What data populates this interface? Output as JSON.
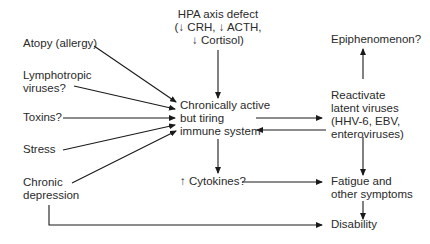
{
  "diagram": {
    "type": "flowchart",
    "nodes": {
      "hpa": {
        "lines": [
          "HPA axis defect",
          "(↓ CRH, ↓ ACTH,",
          "↓ Cortisol)"
        ]
      },
      "atopy": {
        "lines": [
          "Atopy (allergy)"
        ]
      },
      "lymphotropic": {
        "lines": [
          "Lymphotropic",
          "viruses?"
        ]
      },
      "toxins": {
        "lines": [
          "Toxins?"
        ]
      },
      "stress": {
        "lines": [
          "Stress"
        ]
      },
      "depression": {
        "lines": [
          "Chronic",
          "depression"
        ]
      },
      "immune": {
        "lines": [
          "Chronically active",
          "but tiring",
          "immune system"
        ]
      },
      "cytokines": {
        "lines": [
          "↑ Cytokines?"
        ]
      },
      "epiphenomenon": {
        "lines": [
          "Epiphenomenon?"
        ]
      },
      "reactivate": {
        "lines": [
          "Reactivate",
          "latent viruses",
          "(HHV-6, EBV,",
          "enteroviruses)"
        ]
      },
      "fatigue": {
        "lines": [
          "Fatigue and",
          "other symptoms"
        ]
      },
      "disability": {
        "lines": [
          "Disability"
        ]
      }
    },
    "edges": [
      {
        "from": "hpa",
        "to": "immune"
      },
      {
        "from": "atopy",
        "to": "immune"
      },
      {
        "from": "lymphotropic",
        "to": "immune"
      },
      {
        "from": "toxins",
        "to": "immune"
      },
      {
        "from": "stress",
        "to": "immune"
      },
      {
        "from": "depression",
        "to": "immune"
      },
      {
        "from": "immune",
        "to": "reactivate"
      },
      {
        "from": "reactivate",
        "to": "immune"
      },
      {
        "from": "reactivate",
        "to": "epiphenomenon"
      },
      {
        "from": "immune",
        "to": "cytokines"
      },
      {
        "from": "cytokines",
        "to": "fatigue"
      },
      {
        "from": "reactivate",
        "to": "fatigue"
      },
      {
        "from": "fatigue",
        "to": "disability"
      },
      {
        "from": "depression",
        "to": "disability"
      }
    ],
    "colors": {
      "line": "#1a1a1a",
      "text": "#2a2a2a",
      "background": "#ffffff"
    }
  }
}
